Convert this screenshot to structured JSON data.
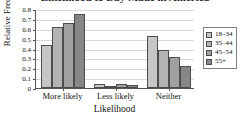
{
  "chart_data": {
    "type": "bar",
    "title": "Likelihood to Buy Made in America",
    "xlabel": "Likelihood",
    "ylabel": "Relative Frequency",
    "categories": [
      "More likely",
      "Less likely",
      "Neither"
    ],
    "series": [
      {
        "name": "18–34",
        "color": "#c6c6c6",
        "values": [
          0.44,
          0.04,
          0.53
        ]
      },
      {
        "name": "35–44",
        "color": "#b4b4b4",
        "values": [
          0.62,
          0.01,
          0.38
        ]
      },
      {
        "name": "45–54",
        "color": "#a0a0a0",
        "values": [
          0.66,
          0.04,
          0.31
        ]
      },
      {
        "name": "55+",
        "color": "#868686",
        "values": [
          0.75,
          0.03,
          0.22
        ]
      }
    ],
    "ylim": [
      0,
      0.8
    ],
    "yticks": [
      0,
      0.1,
      0.2,
      0.3,
      0.4,
      0.5,
      0.6,
      0.7,
      0.8
    ],
    "ytick_labels": [
      "0",
      "0.1",
      "0.2",
      "0.3",
      "0.4",
      "0.5",
      "0.6",
      "0.7",
      "0.8"
    ],
    "grid": true,
    "grid_axis": "y",
    "legend_position": "right",
    "legend_entries": [
      "18–34",
      "35–44",
      "45–54",
      "55+"
    ]
  }
}
